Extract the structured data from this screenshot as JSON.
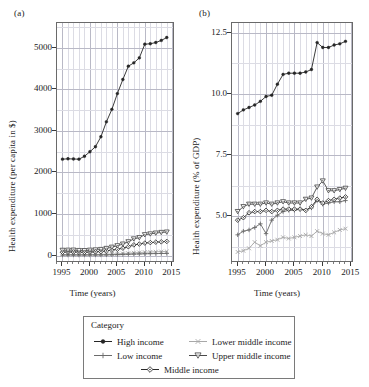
{
  "figure": {
    "xlabel": "Time (years)",
    "panel_a_tag": "(a)",
    "panel_b_tag": "(b)"
  },
  "legend": {
    "title": "Category",
    "entries": [
      {
        "label": "High income",
        "marker": "filled-circle",
        "color": "#262626"
      },
      {
        "label": "Low income",
        "marker": "plus",
        "color": "#6b6b6b"
      },
      {
        "label": "Middle income",
        "marker": "open-diamond",
        "color": "#2b2b2b"
      },
      {
        "label": "Lower middle income",
        "marker": "cross-x",
        "color": "#a8a8a8"
      },
      {
        "label": "Upper middle income",
        "marker": "down-triangle",
        "color": "#4a4a4a"
      }
    ]
  },
  "chart_data": [
    {
      "id": "panel-a",
      "type": "line",
      "title": "(a)",
      "xlabel": "Time (years)",
      "ylabel": "Health expenditure (per capita in $)",
      "xlim": [
        1994,
        2015.5
      ],
      "ylim": [
        -180,
        5600
      ],
      "xticks": [
        1995,
        2000,
        2005,
        2010,
        2015
      ],
      "yticks": [
        0,
        1000,
        2000,
        3000,
        4000,
        5000
      ],
      "grid": true,
      "legend_position": "below-figure",
      "x": [
        1995,
        1996,
        1997,
        1998,
        1999,
        2000,
        2001,
        2002,
        2003,
        2004,
        2005,
        2006,
        2007,
        2008,
        2009,
        2010,
        2011,
        2012,
        2013,
        2014
      ],
      "series": [
        {
          "name": "High income",
          "marker": "filled-circle",
          "color": "#262626",
          "values": [
            2320,
            2330,
            2325,
            2320,
            2390,
            2500,
            2620,
            2860,
            3220,
            3520,
            3900,
            4240,
            4560,
            4640,
            4760,
            5090,
            5100,
            5130,
            5180,
            5250
          ]
        },
        {
          "name": "Upper middle income",
          "marker": "down-triangle",
          "color": "#4a4a4a",
          "values": [
            125,
            128,
            130,
            120,
            118,
            128,
            135,
            145,
            170,
            200,
            235,
            275,
            330,
            400,
            430,
            500,
            520,
            540,
            555,
            565
          ]
        },
        {
          "name": "Middle income",
          "marker": "open-diamond",
          "color": "#2b2b2b",
          "values": [
            80,
            83,
            85,
            80,
            78,
            84,
            90,
            96,
            112,
            130,
            152,
            178,
            212,
            256,
            276,
            300,
            312,
            322,
            330,
            340
          ]
        },
        {
          "name": "Lower middle income",
          "marker": "cross-x",
          "color": "#a8a8a8",
          "values": [
            22,
            23,
            24,
            23,
            22,
            24,
            26,
            28,
            32,
            36,
            42,
            48,
            56,
            66,
            72,
            80,
            85,
            90,
            94,
            98
          ]
        },
        {
          "name": "Low income",
          "marker": "plus",
          "color": "#6b6b6b",
          "values": [
            12,
            12,
            13,
            12,
            12,
            13,
            14,
            15,
            17,
            20,
            23,
            27,
            31,
            36,
            39,
            43,
            45,
            47,
            49,
            51
          ]
        }
      ]
    },
    {
      "id": "panel-b",
      "type": "line",
      "title": "(b)",
      "xlabel": "Time (years)",
      "ylabel": "Health expenditure (% of GDP)",
      "xlim": [
        1994,
        2015.5
      ],
      "ylim": [
        3.1,
        12.9
      ],
      "xticks": [
        1995,
        2000,
        2005,
        2010,
        2015
      ],
      "yticks": [
        5.0,
        7.5,
        10.0,
        12.5
      ],
      "ytick_labels": [
        "5.0",
        "7.5",
        "10.0",
        "12.5"
      ],
      "grid": true,
      "legend_position": "below-figure",
      "x": [
        1995,
        1996,
        1997,
        1998,
        1999,
        2000,
        2001,
        2002,
        2003,
        2004,
        2005,
        2006,
        2007,
        2008,
        2009,
        2010,
        2011,
        2012,
        2013,
        2014
      ],
      "series": [
        {
          "name": "High income",
          "marker": "filled-circle",
          "color": "#262626",
          "values": [
            9.2,
            9.35,
            9.45,
            9.55,
            9.7,
            9.9,
            9.95,
            10.4,
            10.8,
            10.85,
            10.85,
            10.85,
            10.9,
            11.0,
            12.1,
            11.9,
            11.9,
            12.0,
            12.05,
            12.15
          ]
        },
        {
          "name": "Upper middle income",
          "marker": "down-triangle",
          "color": "#4a4a4a",
          "values": [
            5.2,
            5.4,
            5.5,
            5.5,
            5.5,
            5.55,
            5.5,
            5.55,
            5.6,
            5.55,
            5.55,
            5.55,
            5.7,
            5.75,
            6.2,
            6.45,
            6.05,
            6.05,
            6.1,
            6.15
          ]
        },
        {
          "name": "Middle income",
          "marker": "open-diamond",
          "color": "#2b2b2b",
          "values": [
            4.85,
            4.95,
            5.15,
            5.2,
            5.2,
            5.25,
            5.2,
            5.25,
            5.3,
            5.3,
            5.3,
            5.3,
            5.25,
            5.4,
            5.7,
            5.55,
            5.65,
            5.7,
            5.75,
            5.8
          ]
        },
        {
          "name": "Lower middle income",
          "marker": "cross-x",
          "color": "#a8a8a8",
          "values": [
            3.55,
            3.6,
            3.7,
            3.95,
            3.8,
            3.95,
            4.0,
            4.05,
            4.15,
            4.1,
            4.15,
            4.2,
            4.25,
            4.2,
            4.4,
            4.3,
            4.25,
            4.35,
            4.45,
            4.5
          ]
        },
        {
          "name": "Low income",
          "marker": "plus",
          "color": "#6b6b6b",
          "values": [
            4.25,
            4.4,
            4.45,
            4.55,
            4.7,
            4.3,
            4.85,
            5.05,
            5.2,
            5.25,
            5.25,
            5.3,
            5.25,
            5.35,
            5.65,
            5.5,
            5.55,
            5.6,
            5.6,
            5.65
          ]
        }
      ]
    }
  ]
}
